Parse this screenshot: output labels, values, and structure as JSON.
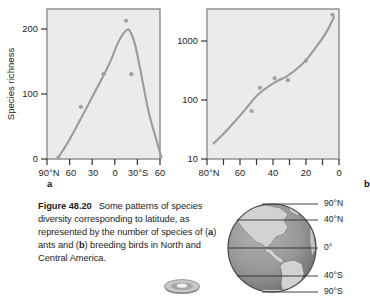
{
  "figure": {
    "caption_label": "Figure 48.20",
    "caption_text": "Some patterns of species diversity corresponding to latitude, as represented by the number of species of (a) ants and (b) breeding birds in North and Central America.",
    "caption_line1": "Some patterns of",
    "caption_line2_pre": "species diversity corresponding",
    "caption_line3": "to latitude, as represented by the",
    "caption_line4_pre": "number of species of (",
    "caption_line4_bold": "a",
    "caption_line4_post": ") ants",
    "caption_line5_pre": "and (",
    "caption_line5_bold": "b",
    "caption_line5_post": ") breeding birds in North",
    "caption_line6": "and Central America.",
    "panel_a_letter": "a",
    "panel_b_letter": "b",
    "disc_icon_name": "media-disc-icon"
  },
  "colors": {
    "plot_background": "#ebebeb",
    "plot_border": "#8c8c8c",
    "curve": "#9b9b9b",
    "point": "#a0a0a0",
    "text": "#1d1d1d",
    "globe_ocean": "#969696",
    "globe_land": "#cfcfcf",
    "globe_outline": "#5a5a5a"
  },
  "globe": {
    "name": "earth-globe-americas",
    "latitude_labels": [
      {
        "text": "90°N",
        "y": 4
      },
      {
        "text": "40°N",
        "y": 22
      },
      {
        "text": "0°",
        "y": 53
      },
      {
        "text": "40°S",
        "y": 83
      },
      {
        "text": "90°S",
        "y": 100
      }
    ]
  },
  "chart_data": [
    {
      "type": "line",
      "panel": "a",
      "title": "",
      "xlabel": "",
      "ylabel": "Species richness",
      "subject": "ants",
      "xticklabels": [
        "90°N",
        "60",
        "30",
        "0",
        "30°S",
        "60"
      ],
      "xtickvalues": [
        90,
        60,
        30,
        0,
        -30,
        -60
      ],
      "yticklabels": [
        "0",
        "100",
        "200"
      ],
      "ytickvalues": [
        0,
        100,
        200
      ],
      "ylim": [
        0,
        230
      ],
      "xlim": [
        90,
        -60
      ],
      "yscale": "linear",
      "grid": false,
      "legend": "none",
      "x": [
        75,
        60,
        45,
        30,
        15,
        5,
        -5,
        -15,
        -20,
        -27,
        -35,
        -45,
        -55,
        -62
      ],
      "values": [
        2,
        30,
        62,
        95,
        128,
        152,
        180,
        197,
        196,
        175,
        130,
        72,
        30,
        2
      ],
      "points_x": [
        75,
        45,
        15,
        -15,
        -22
      ],
      "points_y": [
        2,
        80,
        130,
        212,
        130
      ]
    },
    {
      "type": "scatter",
      "panel": "b",
      "title": "",
      "xlabel": "",
      "ylabel": "",
      "subject": "breeding birds",
      "xticklabels": [
        "80°N",
        "60",
        "40",
        "20",
        "0"
      ],
      "xtickvalues": [
        80,
        60,
        40,
        20,
        0
      ],
      "yticklabels": [
        "10",
        "100",
        "1000"
      ],
      "ytickvalues": [
        10,
        100,
        1000
      ],
      "ylim": [
        10,
        3000
      ],
      "xlim": [
        80,
        0
      ],
      "yscale": "log",
      "grid": false,
      "legend": "none",
      "x": [
        76,
        70,
        63,
        56,
        50,
        44,
        38,
        32,
        26,
        20,
        14,
        8,
        3
      ],
      "values": [
        18,
        26,
        42,
        70,
        110,
        150,
        190,
        230,
        300,
        430,
        700,
        1200,
        2200
      ],
      "points_x": [
        53,
        48,
        39,
        31,
        20,
        4
      ],
      "points_y": [
        62,
        150,
        215,
        200,
        420,
        2400
      ]
    }
  ]
}
